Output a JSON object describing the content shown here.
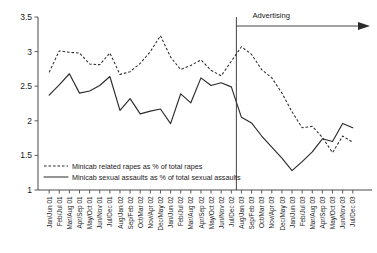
{
  "chart_data": {
    "type": "line",
    "title": "",
    "xlabel": "",
    "ylabel": "",
    "ylim": [
      1,
      3.5
    ],
    "ytick_labels": [
      "3.5",
      "3",
      "2.5",
      "2",
      "1.5",
      "1"
    ],
    "ytick_values": [
      3.5,
      3,
      2.5,
      2,
      1.5,
      1
    ],
    "grid": false,
    "legend_position": "lower-left-inside",
    "categories": [
      "Jan/Jun 01",
      "Feb/Jul 01",
      "Mar/Aug 01",
      "Apr/Sep 01",
      "May/Oct 01",
      "Jun/Nov 01",
      "Jul/Dec 01",
      "Aug/Jan 02",
      "Sep/Feb 02",
      "Oct/Mar 02",
      "Nov/Apr 02",
      "Dec/May 02",
      "Jan/Jun 02",
      "Feb/Jul 02",
      "Mar/Aug 02",
      "Apr/Sep 02",
      "May/Oct 02",
      "Jun/Nov 02",
      "Jul/Dec 02",
      "Aug/Jan 03",
      "Sep/Feb 03",
      "Oct/Mar 03",
      "Nov/Apr 03",
      "Dec/May 03",
      "Jan/Jun 03",
      "Feb/Jul 03",
      "Mar/Aug 03",
      "Apr/Sep 03",
      "May/Oct 03",
      "Jun/Nov 03",
      "Jul/Dec 03"
    ],
    "series": [
      {
        "name": "Minicab related rapes as % of total rapes",
        "style": "dashed",
        "color": "#2b2b2b",
        "values": [
          2.7,
          3.01,
          2.99,
          2.98,
          2.82,
          2.81,
          2.98,
          2.67,
          2.71,
          2.83,
          3.0,
          3.23,
          2.92,
          2.74,
          2.8,
          2.88,
          2.73,
          2.65,
          2.86,
          3.07,
          2.96,
          2.74,
          2.62,
          2.4,
          2.13,
          1.9,
          1.92,
          1.76,
          1.54,
          1.78,
          1.69
        ]
      },
      {
        "name": "Minicab sexual assaults as % of total sexual assaults",
        "style": "solid",
        "color": "#2b2b2b",
        "values": [
          2.37,
          2.52,
          2.68,
          2.4,
          2.43,
          2.51,
          2.64,
          2.15,
          2.32,
          2.1,
          2.14,
          2.17,
          1.96,
          2.39,
          2.26,
          2.62,
          2.51,
          2.55,
          2.49,
          2.05,
          1.97,
          1.78,
          1.62,
          1.46,
          1.28,
          1.41,
          1.55,
          1.74,
          1.7,
          1.96,
          1.9
        ]
      }
    ],
    "annotations": [
      {
        "label": "Advertising",
        "type": "vertical-line-with-arrow",
        "at_category": "Jul/Dec 02",
        "direction": "right"
      }
    ]
  }
}
